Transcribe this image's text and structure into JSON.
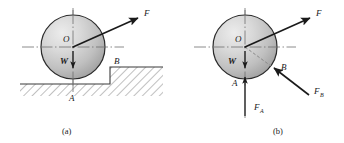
{
  "figure": {
    "panels": [
      {
        "id": "a",
        "caption": "(a)",
        "description": "Cylinder resting on stepped ground with applied force F",
        "labels": {
          "center": "O",
          "weight": "W",
          "applied_force": "F",
          "contact_ground": "A",
          "contact_step": "B"
        },
        "vectors": [
          {
            "name": "F",
            "label": "F",
            "direction": "up-right",
            "angle_deg": 33
          },
          {
            "name": "W",
            "label": "W",
            "direction": "down",
            "angle_deg": 270
          }
        ],
        "geometry": {
          "circle_center": [
            73,
            47
          ],
          "circle_radius": 32,
          "lower_ground_y": 84,
          "step_top_y": 67,
          "step_x": 110
        }
      },
      {
        "id": "b",
        "caption": "(b)",
        "description": "Free body diagram of the cylinder with reaction forces",
        "labels": {
          "center": "O",
          "weight": "W",
          "applied_force": "F",
          "contact_ground": "A",
          "contact_step": "B",
          "reaction_ground": "F",
          "reaction_ground_sub": "A",
          "reaction_step": "F",
          "reaction_step_sub": "B"
        },
        "vectors": [
          {
            "name": "F",
            "label": "F",
            "direction": "up-right",
            "angle_deg": 33
          },
          {
            "name": "W",
            "label": "W",
            "direction": "down",
            "angle_deg": 270
          },
          {
            "name": "F_A",
            "label": "F",
            "sub": "A",
            "direction": "up",
            "angle_deg": 90
          },
          {
            "name": "F_B",
            "label": "F",
            "sub": "B",
            "direction": "up-left",
            "angle_deg": 135
          }
        ],
        "geometry": {
          "circle_center": [
            245,
            47
          ],
          "circle_radius": 32
        }
      }
    ],
    "colors": {
      "sphere_light": "#e3e3e3",
      "sphere_mid": "#c6c6c6",
      "sphere_dark": "#9a9a9a",
      "outline": "#2b2b2b",
      "axis": "#6e6e6e",
      "arrow": "#1a1a1a",
      "hatch": "#4a4a4a",
      "background": "#ffffff"
    }
  }
}
